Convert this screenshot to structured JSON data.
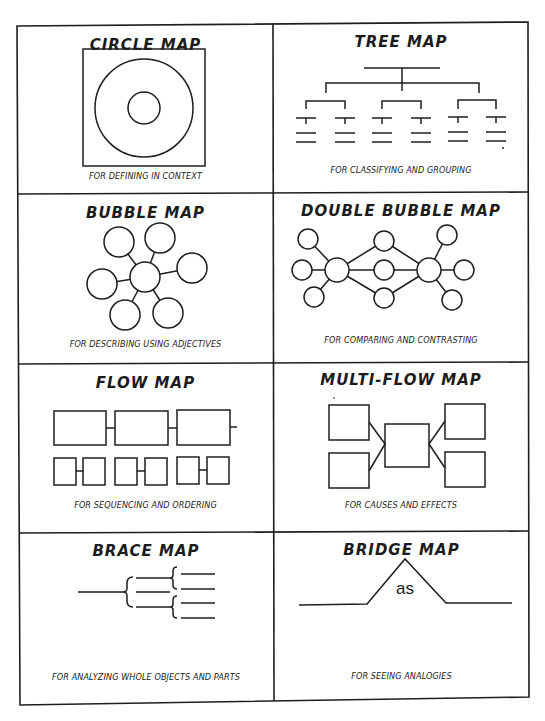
{
  "maps": [
    {
      "id": "circle",
      "title": "CIRCLE MAP",
      "caption": "FOR DEFINING IN CONTEXT"
    },
    {
      "id": "tree",
      "title": "TREE MAP",
      "caption": "FOR CLASSIFYING AND GROUPING"
    },
    {
      "id": "bubble",
      "title": "BUBBLE MAP",
      "caption": "FOR DESCRIBING USING ADJECTIVES"
    },
    {
      "id": "double-bubble",
      "title": "DOUBLE BUBBLE MAP",
      "caption": "FOR COMPARING AND CONTRASTING"
    },
    {
      "id": "flow",
      "title": "FLOW MAP",
      "caption": "FOR SEQUENCING AND ORDERING"
    },
    {
      "id": "multi-flow",
      "title": "MULTI-FLOW MAP",
      "caption": "FOR CAUSES AND EFFECTS"
    },
    {
      "id": "brace",
      "title": "BRACE MAP",
      "caption": "FOR ANALYZING WHOLE OBJECTS AND PARTS"
    },
    {
      "id": "bridge",
      "title": "BRIDGE MAP",
      "caption": "FOR SEEING ANALOGIES",
      "relating_factor": "as"
    }
  ],
  "colors": {
    "line": "#1e1e1e",
    "background": "#ffffff"
  }
}
